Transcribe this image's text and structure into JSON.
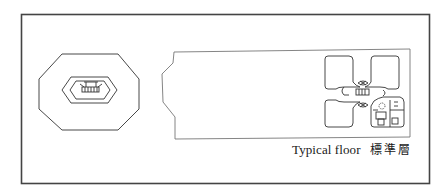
{
  "figure": {
    "caption_en": "Typical floor",
    "caption_zh": "標準層",
    "colors": {
      "line": "#3a3a3a",
      "frame": "#444444",
      "background": "#ffffff"
    }
  }
}
